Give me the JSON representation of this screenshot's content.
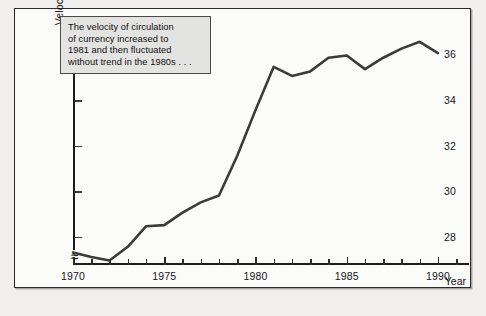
{
  "figure": {
    "frame_border_color": "#2b2b2b",
    "background": "#fbfbfa",
    "line_color": "#3b3b3b",
    "note_bg": "#e3e3e1"
  },
  "annotation": {
    "name": "chart-annotation-box",
    "line1": "The velocity of circulation",
    "line2": "of currency increased to",
    "line3": "1981 and then fluctuated",
    "line4": "without trend in the 1980s . . ."
  },
  "chart_data": {
    "type": "line",
    "title": "",
    "xlabel": "Year",
    "ylabel": "Velocity of circulation of currency (GDP/Currency)",
    "ylabel_line1": "Velocity of circulation of currency",
    "ylabel_line2": "(GDP/Currency)",
    "xlim": [
      1970,
      1991.7
    ],
    "ylim": [
      26.8,
      37.6
    ],
    "y_axis_break": true,
    "y_axis_break_symbol": "≈",
    "grid": false,
    "legend": "none",
    "yticks": [
      28,
      30,
      32,
      34,
      36
    ],
    "ytick_labels": [
      "28",
      "30",
      "32",
      "34",
      "36"
    ],
    "xticks": [
      1970,
      1971,
      1972,
      1973,
      1974,
      1975,
      1976,
      1977,
      1978,
      1979,
      1980,
      1981,
      1982,
      1983,
      1984,
      1985,
      1986,
      1987,
      1988,
      1989,
      1990,
      1991
    ],
    "xtick_major": [
      1970,
      1975,
      1980,
      1985,
      1990
    ],
    "xtick_major_labels": [
      "1970",
      "1975",
      "1980",
      "1985",
      "1990"
    ],
    "series": [
      {
        "name": "Velocity of circulation of currency",
        "x": [
          1970,
          1971,
          1972,
          1973,
          1974,
          1975,
          1976,
          1977,
          1978,
          1979,
          1980,
          1981,
          1982,
          1983,
          1984,
          1985,
          1986,
          1987,
          1988,
          1989,
          1990
        ],
        "values": [
          27.35,
          27.15,
          27.0,
          27.6,
          28.5,
          28.55,
          29.1,
          29.55,
          29.85,
          31.6,
          33.6,
          35.5,
          35.1,
          35.3,
          35.9,
          36.0,
          35.4,
          35.9,
          36.3,
          36.6,
          36.1
        ]
      }
    ]
  }
}
